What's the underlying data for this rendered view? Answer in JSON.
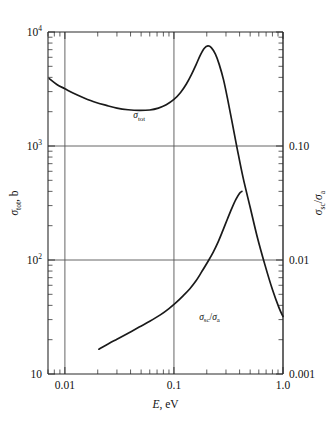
{
  "figure": {
    "title": "",
    "background_color": "#ffffff",
    "line_color": "#1a1a1a",
    "grid_color": "#555555"
  },
  "axes": {
    "x": {
      "label": "E, eV",
      "label_symbol": "E",
      "label_unit": ", eV",
      "scale": "log",
      "min": 0.007,
      "max": 1.0,
      "tick_labels": [
        "0.01",
        "0.1",
        "1.0"
      ],
      "tick_values": [
        0.01,
        0.1,
        1.0
      ]
    },
    "y_left": {
      "label": "σtot, b",
      "label_symbol": "σ",
      "label_sub": "tot",
      "label_unit": ", b",
      "scale": "log",
      "min": 10,
      "max": 10000,
      "tick_labels": [
        "10",
        "10²",
        "10³",
        "10⁴"
      ],
      "tick_values": [
        10,
        100,
        1000,
        10000
      ],
      "tick_mantissa": [
        "10",
        "10",
        "10",
        "10"
      ],
      "tick_exponent": [
        "",
        "2",
        "3",
        "4"
      ]
    },
    "y_right": {
      "label": "σsc/σa",
      "label_num_symbol": "σ",
      "label_num_sub": "sc",
      "label_den_symbol": "σ",
      "label_den_sub": "a",
      "scale": "log",
      "min": 0.001,
      "max": 1.0,
      "tick_labels": [
        "0.001",
        "0.01",
        "0.10"
      ],
      "tick_values": [
        0.001,
        0.01,
        0.1
      ]
    }
  },
  "gridlines": {
    "horizontal_values": [
      100,
      1000
    ],
    "vertical_values": [
      0.01,
      0.1,
      1.0
    ]
  },
  "curve_labels": [
    {
      "name": "sigma-tot",
      "text": "σtot",
      "symbol": "σ",
      "sub": "tot",
      "x": 0.048,
      "y": 1750
    },
    {
      "name": "sigma-sc-over-sigma-a",
      "text": "σsc/σa",
      "symbol": "σ",
      "sub1": "sc",
      "slash": "/",
      "sub2": "a",
      "x": 0.065,
      "y": 30
    }
  ],
  "chart_data": {
    "type": "line",
    "title": "",
    "xlabel": "E, eV",
    "ylabel": "σtot, b",
    "ylabel_right": "σsc/σa",
    "xscale": "log",
    "yscale": "log",
    "xlim": [
      0.007,
      1.0
    ],
    "ylim": [
      10,
      10000
    ],
    "ylim_right": [
      0.001,
      1.0
    ],
    "grid": true,
    "legend": "inline-curve-labels",
    "series": [
      {
        "name": "σtot",
        "axis": "left",
        "units": "b",
        "points": [
          [
            0.0072,
            3900
          ],
          [
            0.0085,
            3450
          ],
          [
            0.01,
            3180
          ],
          [
            0.012,
            2900
          ],
          [
            0.015,
            2640
          ],
          [
            0.019,
            2420
          ],
          [
            0.024,
            2270
          ],
          [
            0.03,
            2150
          ],
          [
            0.038,
            2080
          ],
          [
            0.048,
            2050
          ],
          [
            0.06,
            2070
          ],
          [
            0.072,
            2150
          ],
          [
            0.085,
            2300
          ],
          [
            0.1,
            2560
          ],
          [
            0.115,
            2950
          ],
          [
            0.13,
            3500
          ],
          [
            0.145,
            4250
          ],
          [
            0.16,
            5200
          ],
          [
            0.175,
            6300
          ],
          [
            0.19,
            7200
          ],
          [
            0.205,
            7550
          ],
          [
            0.22,
            7300
          ],
          [
            0.24,
            6400
          ],
          [
            0.26,
            5200
          ],
          [
            0.285,
            3800
          ],
          [
            0.31,
            2600
          ],
          [
            0.34,
            1650
          ],
          [
            0.38,
            950
          ],
          [
            0.43,
            530
          ],
          [
            0.5,
            290
          ],
          [
            0.58,
            160
          ],
          [
            0.68,
            92
          ],
          [
            0.8,
            55
          ],
          [
            0.92,
            38
          ],
          [
            1.0,
            32
          ]
        ]
      },
      {
        "name": "σsc/σa",
        "axis": "right",
        "units": "",
        "points": [
          [
            0.0205,
            0.00165
          ],
          [
            0.024,
            0.0018
          ],
          [
            0.03,
            0.00202
          ],
          [
            0.038,
            0.00228
          ],
          [
            0.048,
            0.00258
          ],
          [
            0.06,
            0.0029
          ],
          [
            0.075,
            0.0033
          ],
          [
            0.09,
            0.00375
          ],
          [
            0.105,
            0.00425
          ],
          [
            0.12,
            0.0048
          ],
          [
            0.14,
            0.0056
          ],
          [
            0.16,
            0.0066
          ],
          [
            0.18,
            0.0079
          ],
          [
            0.205,
            0.0097
          ],
          [
            0.23,
            0.0118
          ],
          [
            0.255,
            0.0145
          ],
          [
            0.28,
            0.018
          ],
          [
            0.31,
            0.023
          ],
          [
            0.34,
            0.0285
          ],
          [
            0.37,
            0.034
          ],
          [
            0.4,
            0.0385
          ],
          [
            0.42,
            0.04
          ]
        ]
      }
    ]
  }
}
